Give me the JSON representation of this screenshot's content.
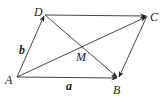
{
  "diagram": {
    "points": {
      "A": {
        "label": "A",
        "x": 17,
        "y": 77
      },
      "B": {
        "label": "B",
        "x": 118,
        "y": 78
      },
      "C": {
        "label": "C",
        "x": 147,
        "y": 16
      },
      "D": {
        "label": "D",
        "x": 45,
        "y": 15
      },
      "M": {
        "label": "M",
        "x": 83,
        "y": 45
      }
    },
    "vectors": {
      "a": {
        "label": "a",
        "from": "A",
        "to": "B"
      },
      "b": {
        "label": "b",
        "from": "A",
        "to": "D"
      }
    },
    "edges": [
      {
        "from": "A",
        "to": "B",
        "arrow": true
      },
      {
        "from": "A",
        "to": "D",
        "arrow": true
      },
      {
        "from": "D",
        "to": "C",
        "arrow": true
      },
      {
        "from": "C",
        "to": "B",
        "arrow": true
      },
      {
        "from": "A",
        "to": "C",
        "arrow": true
      },
      {
        "from": "D",
        "to": "B",
        "arrow": true
      }
    ]
  }
}
